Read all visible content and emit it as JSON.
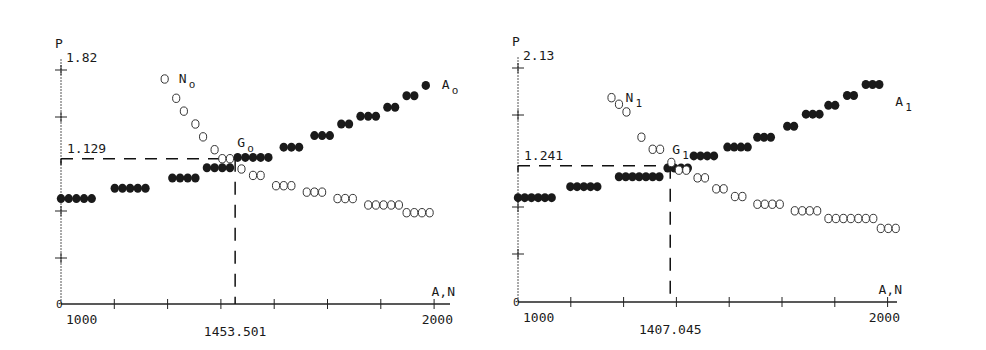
{
  "chart_data": [
    {
      "type": "scatter",
      "title": "",
      "xlabel": "A,N",
      "ylabel": "P",
      "xlim": [
        1000,
        2000
      ],
      "ylim": [
        0,
        1.82
      ],
      "x_tick_labels": [
        "1000",
        "1453.501",
        "2000"
      ],
      "y_tick_labels": [
        "0",
        "1.129",
        "1.82"
      ],
      "y_axis_top_label": "1.82",
      "origin_label": "0",
      "equilibrium": {
        "label": "G0",
        "x": 1453.501,
        "y": 1.129,
        "x_label": "1453.501",
        "y_label": "1.129"
      },
      "series": [
        {
          "name": "A0",
          "label_main": "A",
          "label_sub": "o",
          "marker": "filled",
          "points": [
            [
              1000,
              0.82
            ],
            [
              1020,
              0.82
            ],
            [
              1040,
              0.82
            ],
            [
              1060,
              0.82
            ],
            [
              1080,
              0.82
            ],
            [
              1140,
              0.9
            ],
            [
              1160,
              0.9
            ],
            [
              1180,
              0.9
            ],
            [
              1200,
              0.9
            ],
            [
              1220,
              0.9
            ],
            [
              1290,
              0.98
            ],
            [
              1310,
              0.98
            ],
            [
              1330,
              0.98
            ],
            [
              1350,
              0.98
            ],
            [
              1380,
              1.06
            ],
            [
              1400,
              1.06
            ],
            [
              1420,
              1.06
            ],
            [
              1440,
              1.06
            ],
            [
              1460,
              1.14
            ],
            [
              1480,
              1.14
            ],
            [
              1500,
              1.14
            ],
            [
              1520,
              1.14
            ],
            [
              1540,
              1.14
            ],
            [
              1580,
              1.22
            ],
            [
              1600,
              1.22
            ],
            [
              1620,
              1.22
            ],
            [
              1660,
              1.31
            ],
            [
              1680,
              1.31
            ],
            [
              1700,
              1.31
            ],
            [
              1730,
              1.4
            ],
            [
              1750,
              1.4
            ],
            [
              1780,
              1.46
            ],
            [
              1800,
              1.46
            ],
            [
              1820,
              1.46
            ],
            [
              1850,
              1.53
            ],
            [
              1870,
              1.53
            ],
            [
              1900,
              1.62
            ],
            [
              1920,
              1.62
            ],
            [
              1950,
              1.7
            ]
          ]
        },
        {
          "name": "N0",
          "label_main": "N",
          "label_sub": "o",
          "marker": "open",
          "points": [
            [
              1270,
              1.75
            ],
            [
              1300,
              1.6
            ],
            [
              1320,
              1.5
            ],
            [
              1350,
              1.4
            ],
            [
              1370,
              1.3
            ],
            [
              1400,
              1.2
            ],
            [
              1420,
              1.13
            ],
            [
              1440,
              1.13
            ],
            [
              1470,
              1.05
            ],
            [
              1500,
              1.0
            ],
            [
              1520,
              1.0
            ],
            [
              1560,
              0.92
            ],
            [
              1580,
              0.92
            ],
            [
              1600,
              0.92
            ],
            [
              1640,
              0.87
            ],
            [
              1660,
              0.87
            ],
            [
              1680,
              0.87
            ],
            [
              1720,
              0.82
            ],
            [
              1740,
              0.82
            ],
            [
              1760,
              0.82
            ],
            [
              1800,
              0.77
            ],
            [
              1820,
              0.77
            ],
            [
              1840,
              0.77
            ],
            [
              1860,
              0.77
            ],
            [
              1880,
              0.77
            ],
            [
              1900,
              0.71
            ],
            [
              1920,
              0.71
            ],
            [
              1940,
              0.71
            ],
            [
              1960,
              0.71
            ]
          ]
        }
      ]
    },
    {
      "type": "scatter",
      "title": "",
      "xlabel": "A,N",
      "ylabel": "P",
      "xlim": [
        1000,
        2000
      ],
      "ylim": [
        0,
        2.13
      ],
      "x_tick_labels": [
        "1000",
        "1407.045",
        "2000"
      ],
      "y_tick_labels": [
        "0",
        "1.241",
        "2.13"
      ],
      "y_axis_top_label": "2.13",
      "origin_label": "0",
      "equilibrium": {
        "label": "G1",
        "x": 1407.045,
        "y": 1.241,
        "x_label": "1407.045",
        "y_label": "1.241"
      },
      "series": [
        {
          "name": "A1",
          "label_main": "A",
          "label_sub": "1",
          "marker": "filled",
          "points": [
            [
              1000,
              0.95
            ],
            [
              1018,
              0.95
            ],
            [
              1036,
              0.95
            ],
            [
              1054,
              0.95
            ],
            [
              1072,
              0.95
            ],
            [
              1090,
              0.95
            ],
            [
              1140,
              1.05
            ],
            [
              1158,
              1.05
            ],
            [
              1176,
              1.05
            ],
            [
              1194,
              1.05
            ],
            [
              1212,
              1.05
            ],
            [
              1270,
              1.14
            ],
            [
              1288,
              1.14
            ],
            [
              1306,
              1.14
            ],
            [
              1324,
              1.14
            ],
            [
              1342,
              1.14
            ],
            [
              1360,
              1.14
            ],
            [
              1378,
              1.14
            ],
            [
              1400,
              1.22
            ],
            [
              1418,
              1.22
            ],
            [
              1436,
              1.22
            ],
            [
              1454,
              1.22
            ],
            [
              1470,
              1.33
            ],
            [
              1488,
              1.33
            ],
            [
              1506,
              1.33
            ],
            [
              1524,
              1.33
            ],
            [
              1560,
              1.41
            ],
            [
              1578,
              1.41
            ],
            [
              1596,
              1.41
            ],
            [
              1614,
              1.41
            ],
            [
              1640,
              1.5
            ],
            [
              1658,
              1.5
            ],
            [
              1676,
              1.5
            ],
            [
              1720,
              1.6
            ],
            [
              1738,
              1.6
            ],
            [
              1770,
              1.71
            ],
            [
              1788,
              1.71
            ],
            [
              1806,
              1.71
            ],
            [
              1830,
              1.79
            ],
            [
              1848,
              1.79
            ],
            [
              1880,
              1.88
            ],
            [
              1898,
              1.88
            ],
            [
              1930,
              1.98
            ],
            [
              1948,
              1.98
            ],
            [
              1966,
              1.98
            ]
          ]
        },
        {
          "name": "N1",
          "label_main": "N",
          "label_sub": "1",
          "marker": "open",
          "points": [
            [
              1250,
              1.86
            ],
            [
              1270,
              1.8
            ],
            [
              1290,
              1.73
            ],
            [
              1330,
              1.5
            ],
            [
              1360,
              1.39
            ],
            [
              1380,
              1.39
            ],
            [
              1410,
              1.27
            ],
            [
              1430,
              1.2
            ],
            [
              1450,
              1.2
            ],
            [
              1480,
              1.13
            ],
            [
              1500,
              1.13
            ],
            [
              1530,
              1.03
            ],
            [
              1550,
              1.03
            ],
            [
              1580,
              0.96
            ],
            [
              1600,
              0.96
            ],
            [
              1640,
              0.89
            ],
            [
              1660,
              0.89
            ],
            [
              1680,
              0.89
            ],
            [
              1700,
              0.89
            ],
            [
              1740,
              0.83
            ],
            [
              1760,
              0.83
            ],
            [
              1780,
              0.83
            ],
            [
              1800,
              0.83
            ],
            [
              1830,
              0.76
            ],
            [
              1850,
              0.76
            ],
            [
              1870,
              0.76
            ],
            [
              1890,
              0.76
            ],
            [
              1910,
              0.76
            ],
            [
              1930,
              0.76
            ],
            [
              1950,
              0.76
            ],
            [
              1970,
              0.67
            ],
            [
              1990,
              0.67
            ],
            [
              2010,
              0.67
            ]
          ]
        }
      ]
    }
  ]
}
